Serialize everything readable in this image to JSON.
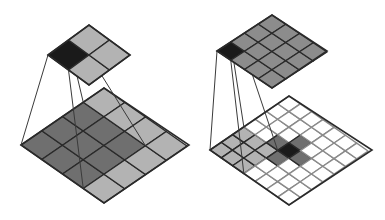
{
  "diagram": {
    "title": "Convolution illustrations",
    "colors": {
      "black": "#1a1a1a",
      "dark_gray": "#6f6f6f",
      "mid_gray": "#8c8c8c",
      "light_gray": "#b3b3b3",
      "white": "#ffffff",
      "grid_line": "#2a2a2a",
      "white_grid_line": "#8a8a8a",
      "projection_line": "#3a3a3a"
    },
    "panels": [
      {
        "name": "left-convolution",
        "output_grid": {
          "rows": 2,
          "cols": 2,
          "cells": [
            [
              "black",
              "light_gray"
            ],
            [
              "light_gray",
              "light_gray"
            ]
          ]
        },
        "input_grid": {
          "rows": 4,
          "cols": 4,
          "cells": [
            [
              "dark_gray",
              "dark_gray",
              "dark_gray",
              "light_gray"
            ],
            [
              "dark_gray",
              "dark_gray",
              "dark_gray",
              "light_gray"
            ],
            [
              "dark_gray",
              "dark_gray",
              "dark_gray",
              "light_gray"
            ],
            [
              "light_gray",
              "light_gray",
              "light_gray",
              "light_gray"
            ]
          ]
        },
        "kernel_size": 3,
        "highlighted_output_cell": [
          0,
          0
        ]
      },
      {
        "name": "right-convolution",
        "output_grid": {
          "rows": 4,
          "cols": 4,
          "cells": [
            [
              "black",
              "mid_gray",
              "mid_gray",
              "mid_gray"
            ],
            [
              "mid_gray",
              "mid_gray",
              "mid_gray",
              "mid_gray"
            ],
            [
              "mid_gray",
              "mid_gray",
              "mid_gray",
              "mid_gray"
            ],
            [
              "mid_gray",
              "mid_gray",
              "mid_gray",
              "mid_gray"
            ]
          ]
        },
        "input_grid": {
          "rows": 7,
          "cols": 7,
          "cells": [
            [
              "light_gray",
              "light_gray",
              "light_gray",
              "white",
              "white",
              "white",
              "white"
            ],
            [
              "light_gray",
              "light_gray",
              "light_gray",
              "white",
              "white",
              "white",
              "white"
            ],
            [
              "light_gray",
              "light_gray",
              "light_gray",
              "dark_gray",
              "white",
              "white",
              "white"
            ],
            [
              "white",
              "white",
              "dark_gray",
              "black",
              "dark_gray",
              "white",
              "white"
            ],
            [
              "white",
              "white",
              "white",
              "dark_gray",
              "white",
              "white",
              "white"
            ],
            [
              "white",
              "white",
              "white",
              "white",
              "white",
              "white",
              "white"
            ],
            [
              "white",
              "white",
              "white",
              "white",
              "white",
              "white",
              "white"
            ]
          ]
        },
        "kernel_size": 3,
        "highlighted_output_cell": [
          0,
          0
        ]
      }
    ]
  }
}
